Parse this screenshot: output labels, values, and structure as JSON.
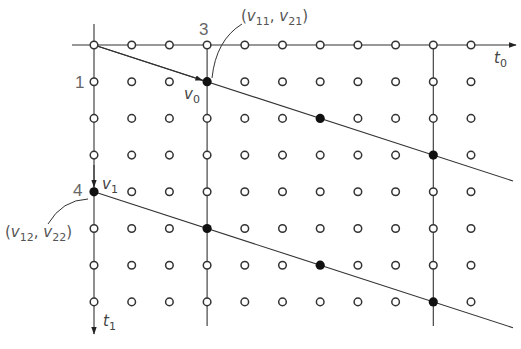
{
  "diagram": {
    "type": "lattice-projection",
    "colors": {
      "line": "#333333",
      "open_dot_stroke": "#333333",
      "filled_dot": "#111111",
      "label": "#555555"
    },
    "grid": {
      "columns": 11,
      "rows": 8,
      "origin_px": [
        94,
        45
      ],
      "col_spacing_px": 37.7,
      "row_spacing_px": 36.7
    },
    "axes": {
      "t0": {
        "label": "t",
        "subscript": "0",
        "direction": "right"
      },
      "t1": {
        "label": "t",
        "subscript": "1",
        "direction": "down"
      }
    },
    "vertical_guides_at_columns": [
      3,
      9
    ],
    "filled_points": [
      {
        "col": 3,
        "row": 1
      },
      {
        "col": 6,
        "row": 2
      },
      {
        "col": 9,
        "row": 3
      },
      {
        "col": 0,
        "row": 4
      },
      {
        "col": 3,
        "row": 5
      },
      {
        "col": 6,
        "row": 6
      },
      {
        "col": 9,
        "row": 7
      }
    ],
    "lines": [
      {
        "from": {
          "col": 0,
          "row": 0
        },
        "through": {
          "col": 3,
          "row": 1
        },
        "name": "upper-hyperplane"
      },
      {
        "from": {
          "col": 0,
          "row": 4
        },
        "through": {
          "col": 3,
          "row": 5
        },
        "name": "lower-hyperplane"
      }
    ],
    "vectors": [
      {
        "name": "v0",
        "label": "v",
        "subscript": "0",
        "from": {
          "col": 0,
          "row": 0
        },
        "to": {
          "col": 3,
          "row": 1
        }
      },
      {
        "name": "v1",
        "label": "v",
        "subscript": "1",
        "from": {
          "col": 0,
          "row": 3
        },
        "to": {
          "col": 0,
          "row": 4
        }
      }
    ],
    "tick_labels": {
      "col3": "3",
      "row1": "1",
      "row4": "4"
    },
    "annotations": {
      "top": {
        "open": "(",
        "v1": "v",
        "s1": "11",
        "comma": ",",
        "v2": "v",
        "s2": "21",
        "close": ")"
      },
      "left": {
        "open": "(",
        "v1": "v",
        "s1": "12",
        "comma": ",",
        "v2": "v",
        "s2": "22",
        "close": ")"
      }
    }
  }
}
